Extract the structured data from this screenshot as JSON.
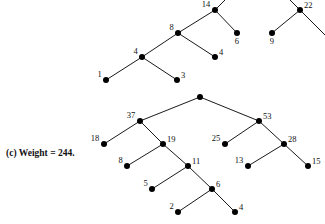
{
  "figure": {
    "caption": "(c) Weight = 244.",
    "width": 325,
    "height": 224,
    "background": "#ffffff",
    "ink_color": "#000000",
    "node_radius": 3,
    "edge_width": 0.9
  },
  "diagram": {
    "type": "binary-tree-diagram",
    "trees": [
      {
        "name": "upper-tree",
        "nodes": [
          {
            "id": "u14",
            "label": "14",
            "x": 215,
            "y": 10,
            "label_pos": "left"
          },
          {
            "id": "u6",
            "label": "6",
            "x": 237,
            "y": 33,
            "label_pos": "below"
          },
          {
            "id": "u8",
            "label": "8",
            "x": 178,
            "y": 33,
            "label_pos": "left"
          },
          {
            "id": "u4b",
            "label": "4",
            "x": 215,
            "y": 57,
            "label_pos": "right"
          },
          {
            "id": "u4a",
            "label": "4",
            "x": 142,
            "y": 57,
            "label_pos": "left"
          },
          {
            "id": "u1",
            "label": "1",
            "x": 106,
            "y": 80,
            "label_pos": "left"
          },
          {
            "id": "u3",
            "label": "3",
            "x": 177,
            "y": 80,
            "label_pos": "right"
          },
          {
            "id": "u22",
            "label": "22",
            "x": 300,
            "y": 10,
            "label_pos": "right"
          },
          {
            "id": "u9",
            "label": "9",
            "x": 272,
            "y": 33,
            "label_pos": "below"
          }
        ],
        "edges": [
          {
            "from": "u14",
            "to": "u8"
          },
          {
            "from": "u14",
            "to": "u6"
          },
          {
            "from": "u8",
            "to": "u4a"
          },
          {
            "from": "u8",
            "to": "u4b"
          },
          {
            "from": "u4a",
            "to": "u1"
          },
          {
            "from": "u4a",
            "to": "u3"
          },
          {
            "from": "u22",
            "to": "u9"
          }
        ],
        "open_edges": [
          {
            "from": "u14",
            "to_x": 238,
            "to_y": -13
          },
          {
            "from": "u22",
            "to_x": 277,
            "to_y": -13
          },
          {
            "from": "u22",
            "to_x": 325,
            "to_y": 35
          }
        ]
      },
      {
        "name": "lower-tree",
        "nodes": [
          {
            "id": "lroot",
            "label": "",
            "x": 200,
            "y": 97,
            "label_pos": "none"
          },
          {
            "id": "l37",
            "label": "37",
            "x": 140,
            "y": 121,
            "label_pos": "left"
          },
          {
            "id": "l53",
            "label": "53",
            "x": 259,
            "y": 121,
            "label_pos": "right"
          },
          {
            "id": "l18",
            "label": "18",
            "x": 104,
            "y": 144,
            "label_pos": "left"
          },
          {
            "id": "l19",
            "label": "19",
            "x": 163,
            "y": 144,
            "label_pos": "right"
          },
          {
            "id": "l25",
            "label": "25",
            "x": 225,
            "y": 144,
            "label_pos": "left"
          },
          {
            "id": "l28",
            "label": "28",
            "x": 284,
            "y": 144,
            "label_pos": "right"
          },
          {
            "id": "l8",
            "label": "8",
            "x": 127,
            "y": 166,
            "label_pos": "left"
          },
          {
            "id": "l11",
            "label": "11",
            "x": 188,
            "y": 166,
            "label_pos": "right"
          },
          {
            "id": "l13",
            "label": "13",
            "x": 248,
            "y": 166,
            "label_pos": "left"
          },
          {
            "id": "l15",
            "label": "15",
            "x": 308,
            "y": 166,
            "label_pos": "right"
          },
          {
            "id": "l5",
            "label": "5",
            "x": 152,
            "y": 189,
            "label_pos": "left"
          },
          {
            "id": "l6",
            "label": "6",
            "x": 212,
            "y": 189,
            "label_pos": "right"
          },
          {
            "id": "l2",
            "label": "2",
            "x": 178,
            "y": 212,
            "label_pos": "left"
          },
          {
            "id": "l4",
            "label": "4",
            "x": 235,
            "y": 212,
            "label_pos": "right"
          }
        ],
        "edges": [
          {
            "from": "lroot",
            "to": "l37"
          },
          {
            "from": "lroot",
            "to": "l53"
          },
          {
            "from": "l37",
            "to": "l18"
          },
          {
            "from": "l37",
            "to": "l19"
          },
          {
            "from": "l53",
            "to": "l25"
          },
          {
            "from": "l53",
            "to": "l28"
          },
          {
            "from": "l19",
            "to": "l8"
          },
          {
            "from": "l19",
            "to": "l11"
          },
          {
            "from": "l28",
            "to": "l13"
          },
          {
            "from": "l28",
            "to": "l15"
          },
          {
            "from": "l11",
            "to": "l5"
          },
          {
            "from": "l11",
            "to": "l6"
          },
          {
            "from": "l6",
            "to": "l2"
          },
          {
            "from": "l6",
            "to": "l4"
          }
        ],
        "open_edges": []
      }
    ]
  }
}
